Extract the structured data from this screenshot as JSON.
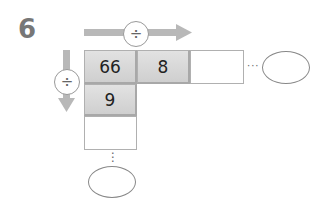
{
  "problem": {
    "number": "6"
  },
  "operators": {
    "horizontal": "÷",
    "vertical": "÷"
  },
  "grid": {
    "row1": [
      "66",
      "8",
      ""
    ],
    "col1": [
      "66",
      "9",
      ""
    ]
  },
  "dots": {
    "horizontal": "···",
    "vertical": "⋮"
  },
  "colors": {
    "arrow": "#b8b8b8",
    "cell_fill": "#d8d8d8",
    "number": "#777777"
  }
}
